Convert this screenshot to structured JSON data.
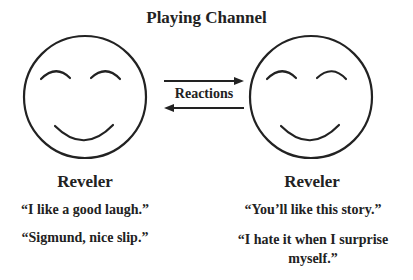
{
  "title": "Playing Channel",
  "channel": {
    "label": "Reactions"
  },
  "left": {
    "name": "Reveler",
    "quotes": [
      "“I like a good laugh.”",
      "“Sigmund, nice slip.”"
    ]
  },
  "right": {
    "name": "Reveler",
    "quotes": [
      "“You’ll like this story.”",
      "“I hate it when I surprise myself.”"
    ]
  },
  "colors": {
    "stroke": "#222222",
    "background": "#ffffff"
  }
}
